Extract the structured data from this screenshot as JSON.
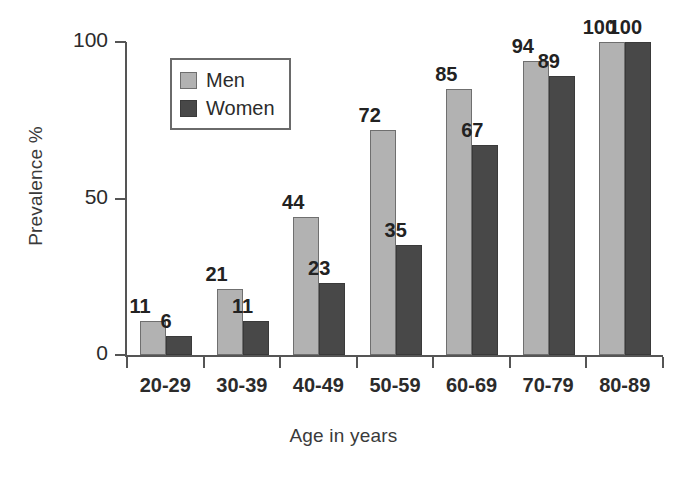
{
  "chart_data": {
    "type": "bar",
    "title": "",
    "xlabel": "Age in years",
    "ylabel": "Prevalence %",
    "categories": [
      "20-29",
      "30-39",
      "40-49",
      "50-59",
      "60-69",
      "70-79",
      "80-89"
    ],
    "series": [
      {
        "name": "Men",
        "color": "#b2b2b2",
        "values": [
          11,
          21,
          44,
          72,
          85,
          94,
          100
        ]
      },
      {
        "name": "Women",
        "color": "#484848",
        "values": [
          6,
          11,
          23,
          35,
          67,
          89,
          100
        ]
      }
    ],
    "ylim": [
      0,
      100
    ],
    "yticks": [
      0,
      50,
      100
    ],
    "ytick_labels": [
      "0",
      "50",
      "100"
    ],
    "grid": false,
    "legend_position": "upper-left-inside",
    "data_labels": true
  },
  "legend": {
    "items": [
      {
        "label": "Men",
        "color": "#b2b2b2"
      },
      {
        "label": "Women",
        "color": "#484848"
      }
    ]
  },
  "axes": {
    "y_title": "Prevalence %",
    "x_title": "Age in years"
  }
}
